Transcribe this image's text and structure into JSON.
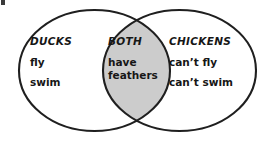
{
  "diagram": {
    "type": "venn-2-circle",
    "background_color": "#ffffff",
    "stroke_color": "#1f1f1f",
    "intersection_fill": "#cccccc",
    "text_color": "#161616",
    "left_set": {
      "title": "DUCKS",
      "items": [
        "fly",
        "swim"
      ]
    },
    "intersection_set": {
      "title": "BOTH",
      "items": [
        "have",
        "feathers"
      ]
    },
    "right_set": {
      "title": "CHICKENS",
      "items": [
        "can’t fly",
        "can’t swim"
      ]
    }
  }
}
